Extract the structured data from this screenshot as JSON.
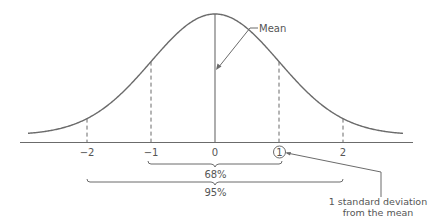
{
  "diagram": {
    "colors": {
      "line": "#6b6b6b",
      "text": "#555555",
      "background": "#ffffff"
    },
    "mean_label": "Mean",
    "axis_ticks": [
      {
        "value": -2,
        "label": "−2"
      },
      {
        "value": -1,
        "label": "−1"
      },
      {
        "value": 0,
        "label": "0"
      },
      {
        "value": 1,
        "label": "1",
        "circled": true
      },
      {
        "value": 2,
        "label": "2"
      }
    ],
    "ranges": [
      {
        "from": -1,
        "to": 1,
        "label": "68%"
      },
      {
        "from": -2,
        "to": 2,
        "label": "95%"
      }
    ],
    "callout": {
      "line1": "1 standard deviation",
      "line2": "from the mean"
    }
  }
}
